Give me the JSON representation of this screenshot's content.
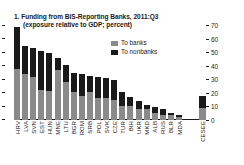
{
  "chart_data": {
    "type": "bar",
    "subtype": "stacked-bar",
    "title": "1. Funding from BIS-Reporting Banks, 2011:Q3",
    "subtitle": "(exposure relative to GDP; percent)",
    "xlabel": "",
    "ylabel": "",
    "ylim": [
      0,
      75
    ],
    "yticks": [
      0,
      10,
      20,
      30,
      40,
      50,
      60,
      70
    ],
    "ytick_labels": [
      "0",
      "10",
      "20",
      "30",
      "40",
      "50",
      "60",
      "70"
    ],
    "y_axis_position": "right",
    "grid": false,
    "legend_position": "upper-right",
    "categories": [
      "HRV",
      "LVA",
      "SVN",
      "EST",
      "HUN",
      "MNE",
      "LTU",
      "BGR",
      "ROM",
      "SRB",
      "POL",
      "SVK",
      "CZE",
      "TUR",
      "BIH",
      "UKR",
      "MKD",
      "ALB",
      "RUS",
      "BLR",
      "MDA"
    ],
    "aggregate_category": "CESEE",
    "series": [
      {
        "name": "To banks",
        "color": "#8a8a8a",
        "values": [
          38.0,
          34.0,
          32.0,
          22.0,
          21.5,
          37.0,
          28.0,
          21.0,
          17.5,
          20.5,
          16.5,
          16.5,
          14.5,
          10.5,
          10.5,
          8.5,
          8.0,
          5.5,
          4.0,
          3.5,
          2.5
        ],
        "aggregate_value": 9.0
      },
      {
        "name": "To nonbanks",
        "color": "#1a1a1a",
        "values": [
          31.0,
          21.0,
          21.5,
          29.0,
          28.0,
          9.0,
          13.0,
          14.0,
          16.5,
          12.5,
          15.5,
          14.5,
          15.0,
          10.0,
          6.5,
          5.5,
          3.0,
          4.0,
          4.0,
          1.5,
          1.5
        ],
        "aggregate_value": 9.0
      }
    ],
    "totals": [
      69.0,
      55.0,
      53.5,
      51.0,
      49.5,
      46.0,
      41.0,
      35.0,
      34.0,
      33.0,
      32.0,
      31.0,
      29.5,
      20.5,
      17.0,
      14.0,
      11.0,
      9.5,
      8.0,
      5.0,
      4.0
    ],
    "aggregate_total": 18.0
  },
  "legend": {
    "items": [
      {
        "label": "To banks",
        "color": "#8a8a8a"
      },
      {
        "label": "To nonbanks",
        "color": "#1a1a1a"
      }
    ]
  }
}
